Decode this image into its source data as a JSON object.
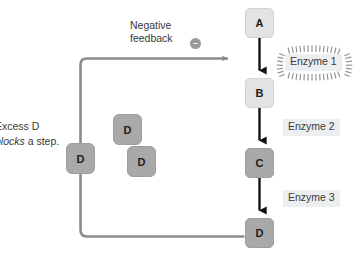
{
  "diagram": {
    "title_caption": "",
    "pathway": {
      "nodes": [
        {
          "id": "node-a",
          "label": "A",
          "tone": "light"
        },
        {
          "id": "node-b",
          "label": "B",
          "tone": "light"
        },
        {
          "id": "node-c",
          "label": "C",
          "tone": "dark"
        },
        {
          "id": "node-d",
          "label": "D",
          "tone": "dark"
        }
      ],
      "enzymes": [
        {
          "id": "enzyme-1",
          "label": "Enzyme 1",
          "highlighted": true
        },
        {
          "id": "enzyme-2",
          "label": "Enzyme 2",
          "highlighted": false
        },
        {
          "id": "enzyme-3",
          "label": "Enzyme 3",
          "highlighted": false
        }
      ]
    },
    "feedback": {
      "label_line1": "Negative",
      "label_line2": "feedback",
      "sign_icon": "minus-circle-icon",
      "sign_symbol": "−"
    },
    "inhibition": {
      "caption_line1": "Excess D",
      "caption_line2_italic": "blocks",
      "caption_line2_rest": " a step.",
      "molecules": [
        {
          "id": "d-molecule-on-path",
          "label": "D"
        },
        {
          "id": "d-molecule-upper",
          "label": "D"
        },
        {
          "id": "d-molecule-lower",
          "label": "D"
        }
      ]
    },
    "colors": {
      "node_light": "#e3e3e3",
      "node_dark": "#a9a9a9",
      "arrow_black": "#121212",
      "feedback_gray": "#8c8c8c",
      "enzyme_plate": "#eceff0",
      "text": "#3a3a3a",
      "background": "#ffffff"
    }
  }
}
